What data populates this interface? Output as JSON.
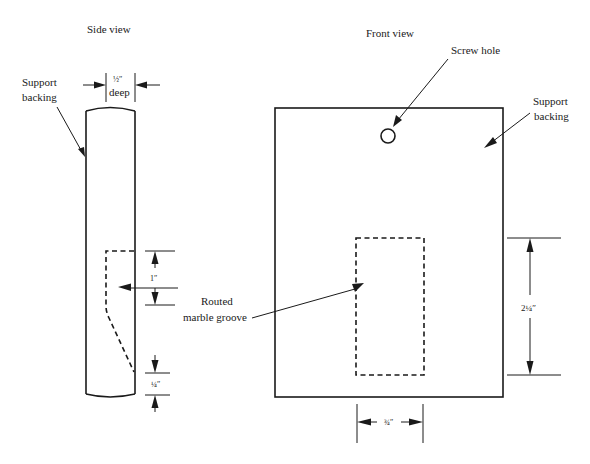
{
  "diagram": {
    "side_view": {
      "title": "Side view",
      "support_label_line1": "Support",
      "support_label_line2": "backing",
      "depth_value": "½″",
      "depth_label": "deep",
      "groove_height": "1″",
      "bottom_offset": "¼″"
    },
    "front_view": {
      "title": "Front view",
      "screw_hole_label": "Screw hole",
      "support_label_line1": "Support",
      "support_label_line2": "backing",
      "groove_height": "2¼″",
      "groove_width": "¾″"
    },
    "shared": {
      "groove_label_line1": "Routed",
      "groove_label_line2": "marble groove"
    },
    "colors": {
      "line": "#1a1a1a",
      "background": "#ffffff"
    }
  }
}
